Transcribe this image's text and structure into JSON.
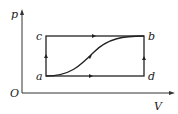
{
  "diagram": {
    "type": "p-V cycle diagram",
    "axes": {
      "y_label": "p",
      "x_label": "V",
      "origin_label": "O"
    },
    "points": {
      "a": "a",
      "b": "b",
      "c": "c",
      "d": "d"
    },
    "paths": [
      "a-c-b (isochoric then isobaric)",
      "a-d-b (isobaric then isochoric)",
      "a-b curve"
    ],
    "colors": {
      "line": "#222222",
      "background": "#ffffff"
    }
  }
}
